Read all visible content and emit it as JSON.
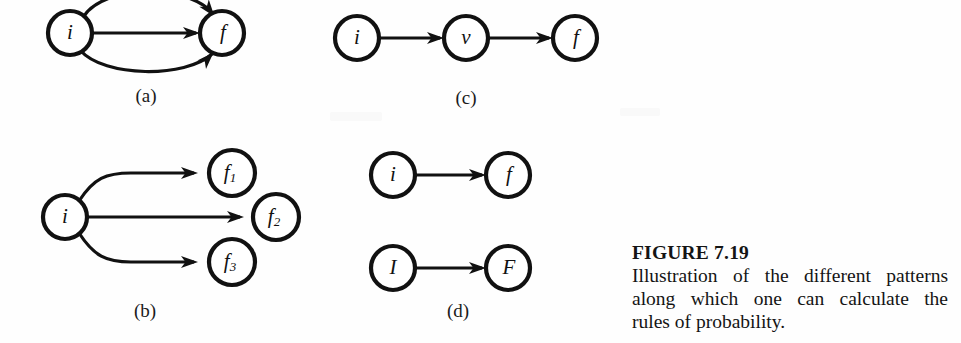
{
  "figure": {
    "caption_title": "FIGURE 7.19",
    "caption_line1": "Illustration of the different patterns",
    "caption_line2": "along which one can calculate the",
    "caption_line3": "rules of probability.",
    "ink_color": "#111111",
    "background_color": "#fefefe"
  },
  "panels": {
    "a": {
      "caption": "(a)",
      "nodes": [
        {
          "id": "a-i",
          "label": "i",
          "sub": ""
        },
        {
          "id": "a-f",
          "label": "f",
          "sub": ""
        }
      ],
      "edges": [
        {
          "from": "i",
          "to": "f",
          "shape": "arc-above"
        },
        {
          "from": "i",
          "to": "f",
          "shape": "straight"
        },
        {
          "from": "i",
          "to": "f",
          "shape": "arc-below"
        }
      ]
    },
    "b": {
      "caption": "(b)",
      "nodes": [
        {
          "id": "b-i",
          "label": "i",
          "sub": ""
        },
        {
          "id": "b-f1",
          "label": "f",
          "sub": "1"
        },
        {
          "id": "b-f2",
          "label": "f",
          "sub": "2"
        },
        {
          "id": "b-f3",
          "label": "f",
          "sub": "3"
        }
      ],
      "edges": [
        {
          "from": "i",
          "to": "f1",
          "shape": "curve-up"
        },
        {
          "from": "i",
          "to": "f2",
          "shape": "straight"
        },
        {
          "from": "i",
          "to": "f3",
          "shape": "curve-down"
        }
      ]
    },
    "c": {
      "caption": "(c)",
      "nodes": [
        {
          "id": "c-i",
          "label": "i",
          "sub": ""
        },
        {
          "id": "c-v",
          "label": "v",
          "sub": ""
        },
        {
          "id": "c-f",
          "label": "f",
          "sub": ""
        }
      ],
      "edges": [
        {
          "from": "i",
          "to": "v",
          "shape": "straight"
        },
        {
          "from": "v",
          "to": "f",
          "shape": "straight"
        }
      ]
    },
    "d": {
      "caption": "(d)",
      "nodes": [
        {
          "id": "d-i",
          "label": "i",
          "sub": ""
        },
        {
          "id": "d-f",
          "label": "f",
          "sub": ""
        },
        {
          "id": "d-I",
          "label": "I",
          "sub": ""
        },
        {
          "id": "d-F",
          "label": "F",
          "sub": ""
        }
      ],
      "edges": [
        {
          "from": "i",
          "to": "f",
          "shape": "straight"
        },
        {
          "from": "I",
          "to": "F",
          "shape": "straight"
        }
      ]
    }
  }
}
